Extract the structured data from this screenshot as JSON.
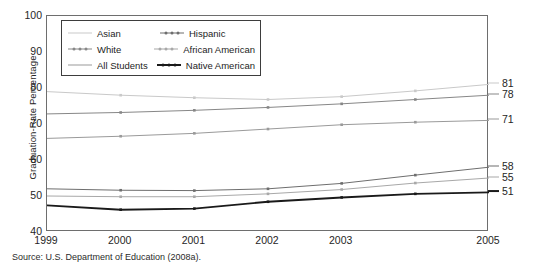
{
  "chart_data": {
    "type": "line",
    "title": "",
    "xlabel": "",
    "ylabel": "Graduation-Rate Percentage",
    "x": [
      1999,
      2000,
      2001,
      2002,
      2003,
      2004,
      2005
    ],
    "xtick_labels": [
      "1999",
      "2000",
      "2001",
      "2002",
      "2003",
      "2005"
    ],
    "xtick_values": [
      1999,
      2000,
      2001,
      2002,
      2003,
      2005
    ],
    "ytick_labels": [
      "40",
      "50",
      "60",
      "70",
      "80",
      "90",
      "100"
    ],
    "ytick_values": [
      40,
      50,
      60,
      70,
      80,
      90,
      100
    ],
    "xlim": [
      1999,
      2005
    ],
    "ylim": [
      40,
      100
    ],
    "grid": false,
    "legend_position": "upper-left-inside",
    "series": [
      {
        "name": "Asian",
        "color": "#c9c9c9",
        "end_label": "81",
        "values": [
          79.0,
          78.0,
          77.3,
          76.8,
          77.6,
          79.2,
          81.0
        ]
      },
      {
        "name": "White",
        "color": "#878787",
        "end_label": "78",
        "values": [
          72.8,
          73.2,
          73.8,
          74.6,
          75.6,
          76.8,
          78.0
        ]
      },
      {
        "name": "All Students",
        "color": "#9a9a9a",
        "end_label": "71",
        "values": [
          66.0,
          66.6,
          67.4,
          68.6,
          69.8,
          70.5,
          71.0
        ]
      },
      {
        "name": "Hispanic",
        "color": "#6e6e6e",
        "end_label": "58",
        "values": [
          52.0,
          51.6,
          51.5,
          52.0,
          53.5,
          55.8,
          58.0
        ]
      },
      {
        "name": "African American",
        "color": "#a8a8a8",
        "end_label": "55",
        "values": [
          50.0,
          49.8,
          49.8,
          50.6,
          51.8,
          53.6,
          55.0
        ]
      },
      {
        "name": "Native American",
        "color": "#1a1a1a",
        "end_label": "51",
        "values": [
          47.4,
          46.2,
          46.5,
          48.4,
          49.6,
          50.6,
          51.0
        ]
      }
    ]
  },
  "legend": {
    "entries": [
      {
        "label": "Asian"
      },
      {
        "label": "Hispanic"
      },
      {
        "label": "White"
      },
      {
        "label": "African American"
      },
      {
        "label": "All Students"
      },
      {
        "label": "Native American"
      }
    ]
  },
  "source": {
    "note": "Source: U.S. Department of Education (2008a)."
  }
}
